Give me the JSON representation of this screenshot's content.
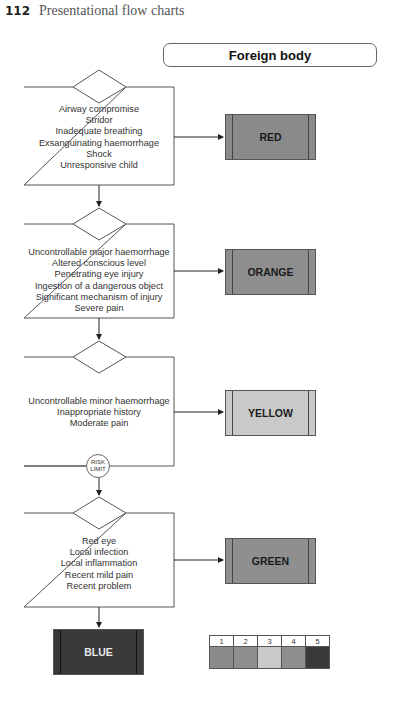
{
  "page_header": {
    "page_number": "112",
    "section_title": "Presentational flow charts"
  },
  "chart": {
    "title": "Foreign body",
    "steps": [
      {
        "criteria": [
          "Airway compromise",
          "Stridor",
          "Inadequate breathing",
          "Exsanguinating haemorrhage",
          "Shock",
          "Unresponsive child"
        ],
        "outcome": "RED"
      },
      {
        "criteria": [
          "Uncontrollable major haemorrhage",
          "Altered conscious level",
          "Penetrating eye injury",
          "Ingestion of a dangerous object",
          "Significant mechanism of injury",
          "Severe pain"
        ],
        "outcome": "ORANGE"
      },
      {
        "criteria": [
          "Uncontrollable minor haemorrhage",
          "Inappropriate history",
          "Moderate pain"
        ],
        "outcome": "YELLOW"
      },
      {
        "criteria": [
          "Red eye",
          "Local infection",
          "Local inflammation",
          "Recent mild pain",
          "Recent problem"
        ],
        "outcome": "GREEN"
      }
    ],
    "risk_limit": {
      "line1": "RISK",
      "line2": "LIMIT"
    },
    "default_outcome": "BLUE",
    "category_colors": {
      "RED": "#8a8a8a",
      "ORANGE": "#8e8e8e",
      "YELLOW": "#c9c9c9",
      "GREEN": "#8f8f8f",
      "BLUE": "#3a3a3a"
    },
    "legend": {
      "numbers": [
        "1",
        "2",
        "3",
        "4",
        "5"
      ],
      "colors": [
        "#8a8a8a",
        "#8e8e8e",
        "#c9c9c9",
        "#8f8f8f",
        "#3a3a3a"
      ]
    }
  }
}
